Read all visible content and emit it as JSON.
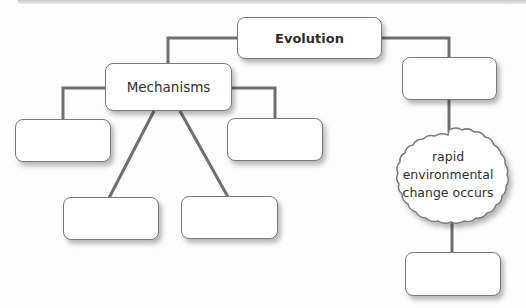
{
  "diagram": {
    "type": "concept-map",
    "colors": {
      "line": "#6e6e6e",
      "node_border": "#7a7a7a",
      "node_fill": "#ffffff",
      "text": "#2e2e2e"
    },
    "nodes": {
      "root": {
        "label": "Evolution"
      },
      "mechanisms": {
        "label": "Mechanisms"
      },
      "mech_left": {
        "label": ""
      },
      "mech_right": {
        "label": ""
      },
      "mech_bottom_left": {
        "label": ""
      },
      "mech_bottom_center": {
        "label": ""
      },
      "right_branch": {
        "label": ""
      },
      "event": {
        "label": "rapid environmental change occurs",
        "shape": "cloud"
      },
      "event_result": {
        "label": ""
      }
    },
    "edges": [
      {
        "from": "root",
        "to": "mechanisms"
      },
      {
        "from": "root",
        "to": "right_branch"
      },
      {
        "from": "mechanisms",
        "to": "mech_left"
      },
      {
        "from": "mechanisms",
        "to": "mech_right"
      },
      {
        "from": "mechanisms",
        "to": "mech_bottom_left"
      },
      {
        "from": "mechanisms",
        "to": "mech_bottom_center"
      },
      {
        "from": "right_branch",
        "to": "event"
      },
      {
        "from": "event",
        "to": "event_result"
      }
    ]
  }
}
